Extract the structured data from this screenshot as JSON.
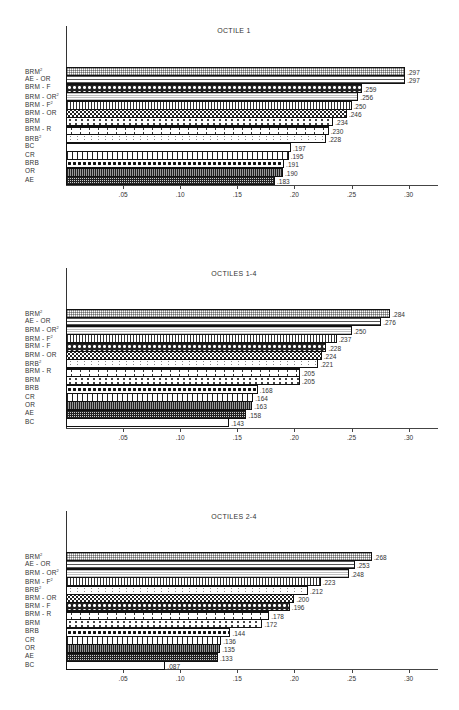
{
  "chart_data": [
    {
      "type": "bar",
      "orientation": "horizontal",
      "title": "OCTILE 1",
      "categories": [
        "BRM ²",
        "AE - OR",
        "BRM - F",
        "BRM - OR ²",
        "BRM - F ²",
        "BRM - OR",
        "BRM",
        "BRM - R",
        "BRB ²",
        "BC",
        "CR",
        "BRB",
        "OR",
        "AE"
      ],
      "values": [
        0.297,
        0.297,
        0.259,
        0.256,
        0.25,
        0.246,
        0.234,
        0.23,
        0.228,
        0.197,
        0.195,
        0.191,
        0.19,
        0.183
      ],
      "value_labels": [
        ".297",
        ".297",
        ".259",
        ".256",
        ".250",
        ".246",
        ".234",
        ".230",
        ".228",
        ".197",
        ".195",
        ".191",
        ".190",
        ".183"
      ],
      "patterns": [
        "fine",
        "hlines",
        "circles",
        "dotgrid",
        "vlines",
        "xcheck",
        "plus",
        "plusbig",
        "sparse",
        "none",
        "vwide",
        "diamond",
        "vdense",
        "grid"
      ],
      "xlabel": "",
      "ylabel": "",
      "xticks": [
        ".05",
        ".10",
        ".15",
        ".20",
        ".25",
        ".30"
      ],
      "xlim": [
        0,
        0.33
      ],
      "grid": false
    },
    {
      "type": "bar",
      "orientation": "horizontal",
      "title": "OCTILES 1-4",
      "categories": [
        "BRM ²",
        "AE - OR",
        "BRM - OR ²",
        "BRM - F ²",
        "BRM - F",
        "BRM - OR",
        "BRB ²",
        "BRM - R",
        "BRM",
        "BRB",
        "CR",
        "OR",
        "AE",
        "BC"
      ],
      "values": [
        0.284,
        0.276,
        0.25,
        0.237,
        0.228,
        0.224,
        0.221,
        0.205,
        0.205,
        0.168,
        0.164,
        0.163,
        0.158,
        0.143
      ],
      "value_labels": [
        ".284",
        ".276",
        ".250",
        ".237",
        ".228",
        ".224",
        ".221",
        ".205",
        ".205",
        ".168",
        ".164",
        ".163",
        ".158",
        ".143"
      ],
      "patterns": [
        "fine",
        "hlines",
        "dotgrid",
        "vlines",
        "circles",
        "xcheck",
        "sparse",
        "plusbig",
        "plus",
        "diamond",
        "vwide",
        "vdense",
        "grid",
        "none"
      ],
      "xlabel": "",
      "ylabel": "",
      "xticks": [
        ".05",
        ".10",
        ".15",
        ".20",
        ".25",
        ".30"
      ],
      "xlim": [
        0,
        0.33
      ],
      "grid": false
    },
    {
      "type": "bar",
      "orientation": "horizontal",
      "title": "OCTILES 2-4",
      "categories": [
        "BRM ²",
        "AE - OR",
        "BRM - OR ²",
        "BRM - F ²",
        "BRB ²",
        "BRM - OR",
        "BRM - F",
        "BRM - R",
        "BRM",
        "BRB",
        "CR",
        "OR",
        "AE",
        "BC"
      ],
      "values": [
        0.268,
        0.253,
        0.248,
        0.223,
        0.212,
        0.2,
        0.196,
        0.178,
        0.172,
        0.144,
        0.136,
        0.135,
        0.133,
        0.087
      ],
      "value_labels": [
        ".268",
        ".253",
        ".248",
        ".223",
        ".212",
        ".200",
        ".196",
        ".178",
        ".172",
        ".144",
        ".136",
        ".135",
        ".133",
        ".087"
      ],
      "patterns": [
        "fine",
        "hlines",
        "dotgrid",
        "vlines",
        "sparse",
        "xcheck",
        "circles",
        "plusbig",
        "plus",
        "diamond",
        "vwide",
        "vdense",
        "grid",
        "none"
      ],
      "xlabel": "",
      "ylabel": "",
      "xticks": [
        ".05",
        ".10",
        ".15",
        ".20",
        ".25",
        ".30"
      ],
      "xlim": [
        0,
        0.33
      ],
      "grid": false
    }
  ],
  "layout": {
    "charts": [
      {
        "axis_top": 26,
        "title_y": 27,
        "bars_top": 67,
        "baseline": 185
      },
      {
        "axis_top": 268,
        "title_y": 270,
        "bars_top": 309,
        "baseline": 428
      },
      {
        "axis_top": 511,
        "title_y": 513,
        "bars_top": 552,
        "baseline": 669
      }
    ]
  }
}
